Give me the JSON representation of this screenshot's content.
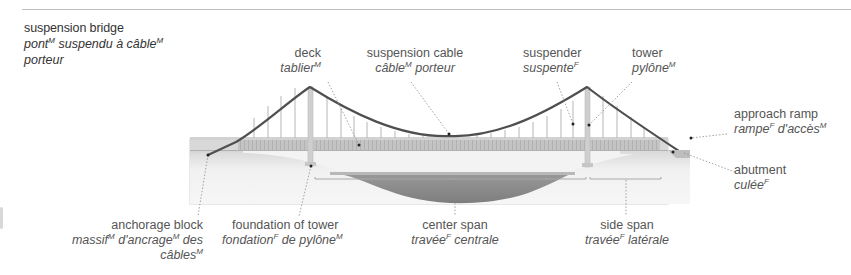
{
  "title": {
    "en": "suspension bridge",
    "fr_line1_a": "pont",
    "fr_line1_a_gender": "M",
    "fr_line1_b": " suspendu à câble",
    "fr_line1_b_gender": "M",
    "fr_line2": "porteur"
  },
  "labels": {
    "deck": {
      "en": "deck",
      "fr": "tablier",
      "gender": "M"
    },
    "suspension_cable": {
      "en": "suspension cable",
      "fr_a": "câble",
      "gender_a": "M",
      "fr_b": " porteur"
    },
    "suspender": {
      "en": "suspender",
      "fr": "suspente",
      "gender": "F"
    },
    "tower": {
      "en": "tower",
      "fr": "pylône",
      "gender": "M"
    },
    "approach_ramp": {
      "en": "approach ramp",
      "fr_a": "rampe",
      "gender_a": "F",
      "fr_b": " d'accès",
      "gender_b": "M"
    },
    "abutment": {
      "en": "abutment",
      "fr": "culée",
      "gender": "F"
    },
    "anchorage_block": {
      "en": "anchorage block",
      "fr_a": "massif",
      "gender_a": "M",
      "fr_b": " d'ancrage",
      "gender_b": "M",
      "fr_c": " des",
      "fr_d": "câbles",
      "gender_d": "M"
    },
    "foundation_of_tower": {
      "en": "foundation of tower",
      "fr_a": "fondation",
      "gender_a": "F",
      "fr_b": " de pylône",
      "gender_b": "M"
    },
    "center_span": {
      "en": "center span",
      "fr_a": "travée",
      "gender_a": "F",
      "fr_b": " centrale"
    },
    "side_span": {
      "en": "side span",
      "fr_a": "travée",
      "gender_a": "F",
      "fr_b": " latérale"
    }
  },
  "colors": {
    "cable": "#4d4d4d",
    "tower": "#cfcfcf",
    "deck": "#bdbdbd",
    "ground": "#eeeeee",
    "water": "#8f8f8f",
    "leader": "#8a8a8a"
  }
}
